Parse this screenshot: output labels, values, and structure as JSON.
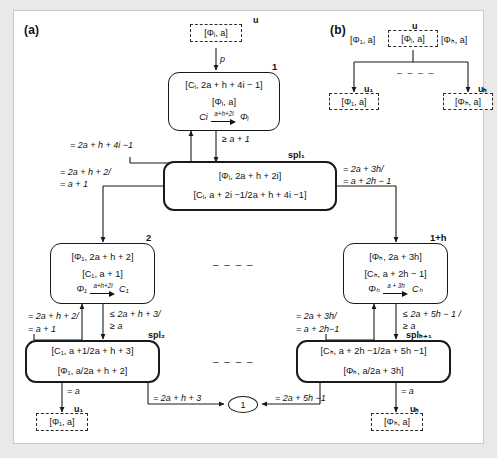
{
  "figure": {
    "panels": [
      {
        "id": "a",
        "label": "(a)"
      },
      {
        "id": "b",
        "label": "(b)"
      }
    ]
  },
  "panel_a": {
    "top_terminal": {
      "name": "u",
      "text": "[Φᵢ, a]"
    },
    "edge_p": "p",
    "node1": {
      "tag": "1",
      "line1": "[Cᵢ, 2a + h + 4i − 1]",
      "line2": "[Φᵢ, a]",
      "transition": {
        "from": "Ci",
        "label": "a+h+2i",
        "to": "Φᵢ"
      }
    },
    "edge_back_to_node1": "= 2a + h + 4i −1",
    "edge_guard_node1": "≥ a + 1",
    "spl1": {
      "tag": "spl₁",
      "line1": "[Φᵢ, 2a + h + 2i]",
      "line2": "[Cᵢ, a + 2i −1/2a + h + 4i −1]"
    },
    "spl1_left_label": {
      "l1": "= 2a + h + 2/",
      "l2": "= a + 1"
    },
    "spl1_right_label": {
      "l1": "= 2a + 3h/",
      "l2": "= a + 2h − 1"
    },
    "node2": {
      "tag": "2",
      "line1": "[Φ₁, 2a + h + 2]",
      "line2": "[C₁, a + 1]",
      "transition": {
        "from": "Φ₁",
        "label": "a+h+2i",
        "to": "C₁"
      }
    },
    "node2_left_label": {
      "l1": "= 2a + h + 2/",
      "l2": "= a + 1"
    },
    "node2_guard": {
      "l1": "≤ 2a + h + 3/",
      "l2": "≥  a"
    },
    "spl2": {
      "tag": "spl₂",
      "line1": "[C₁, a +1/2a + h + 3]",
      "line2": "[Φ₁, a/2a + h + 2]"
    },
    "spl2_out_left": "= a",
    "spl2_out_right": "= 2a + h + 3",
    "terminal_u1": {
      "name": "u₁",
      "text": "[Φ₁, a]"
    },
    "node1h": {
      "tag": "1+h",
      "line1": "[Φₕ, 2a + 3h]",
      "line2": "[Cₕ, a + 2h − 1]",
      "transition": {
        "from": "Φₕ",
        "label": "a + 3h",
        "to": "Cₕ"
      }
    },
    "node1h_left_label": {
      "l1": "= 2a + 3h/",
      "l2": "= a + 2h−1"
    },
    "node1h_guard": {
      "l1": "≤ 2a + 5h − 1 /",
      "l2": "≥  a"
    },
    "splh1": {
      "tag": "splₕ₊₁",
      "line1": "[Cₕ, a + 2h −1/2a + 5h −1]",
      "line2": "[Φₕ, a/2a + 3h]"
    },
    "splh1_out_left": "= 2a + 5h −1",
    "splh1_out_right": "= a",
    "terminal_uh": {
      "name": "uₕ",
      "text": "[Φₕ, a]"
    },
    "join_node": "1",
    "ellipsis": "– – – –"
  },
  "panel_b": {
    "top_terminal": {
      "name": "u",
      "text": "[Φᵢ, a]"
    },
    "left_text": "[Φ₁, a]",
    "right_text": "[Φₕ, a]",
    "terminal_u1": {
      "name": "u₁",
      "text": "[Φ₁, a]"
    },
    "terminal_uh": {
      "name": "uₕ",
      "text": "[Φₕ, a]"
    },
    "ellipsis": "– – – –"
  },
  "colors": {
    "ink": "#111111",
    "frame": "#c8c8c8",
    "page": "#e9e9e9",
    "paper": "#ffffff"
  }
}
